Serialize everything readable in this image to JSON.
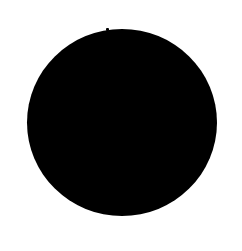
{
  "shape": {
    "type": "filled-circle",
    "color": "#000000",
    "background": "#ffffff"
  }
}
